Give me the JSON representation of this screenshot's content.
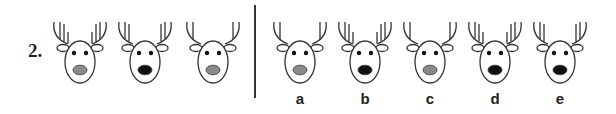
{
  "question": {
    "number": "2.",
    "sequence": [
      {
        "prongs": 3,
        "nose": "gray"
      },
      {
        "prongs": 2,
        "nose": "black"
      },
      {
        "prongs": 1,
        "nose": "gray"
      }
    ]
  },
  "options": [
    {
      "label": "a",
      "prongs": 1,
      "nose": "gray"
    },
    {
      "label": "b",
      "prongs": 3,
      "nose": "black"
    },
    {
      "label": "c",
      "prongs": 1,
      "nose": "gray"
    },
    {
      "label": "d",
      "prongs": 3,
      "nose": "black"
    },
    {
      "label": "e",
      "prongs": 2,
      "nose": "black"
    }
  ],
  "colors": {
    "line": "#333333",
    "nose_gray": "#8a8a8a",
    "nose_black": "#111111",
    "eye": "#111111"
  }
}
